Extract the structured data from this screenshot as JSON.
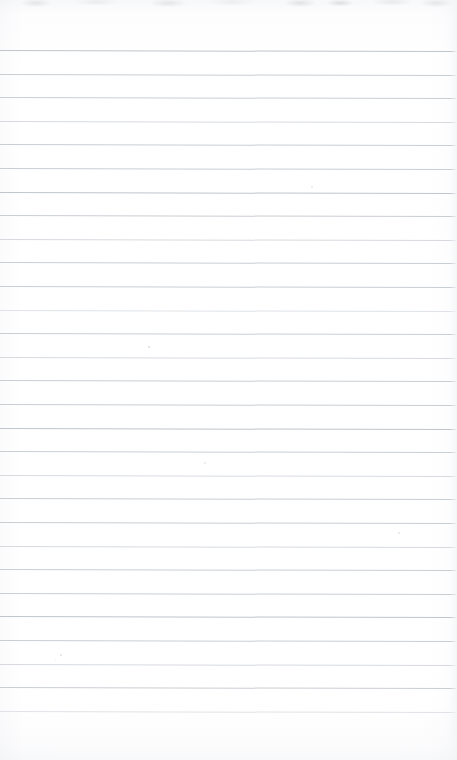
{
  "document": {
    "kind": "scanned-lined-paper",
    "title": "Blank lined notebook page",
    "page_text": "",
    "has_handwriting": false,
    "has_printed_text": false,
    "width_px": 457,
    "height_px": 760
  },
  "appearance": {
    "paper_color": "#ffffff",
    "paper_tint": "#fbfbfc",
    "rule_color": "#c9ced3",
    "rule_color_light": "#dfe3e7",
    "rule_color_dark": "#bfc5cb",
    "edge_shadow_color": "#f7f8f9",
    "smudge_color": "#c4c8cd"
  },
  "ruling": {
    "line_count": 29,
    "first_line_y": 50,
    "spacing_px": 23.6,
    "line_thickness_px": 1,
    "left_inset_px": 0,
    "right_inset_px": 0,
    "skew_deg": 0.14,
    "margin_rule": "none",
    "holes": "none",
    "line_y_positions": [
      50,
      73.6,
      97.2,
      120.8,
      144.4,
      168,
      191.6,
      215.2,
      238.8,
      262.4,
      286,
      309.6,
      333.2,
      356.8,
      380.4,
      404,
      427.6,
      451.2,
      474.8,
      498.4,
      522,
      545.6,
      569.2,
      592.8,
      616.4,
      640,
      663.6,
      687.2,
      710.8
    ],
    "line_weights": [
      "dark",
      "normal",
      "normal",
      "soft",
      "normal",
      "normal",
      "dark",
      "normal",
      "soft",
      "normal",
      "normal",
      "softer",
      "normal",
      "soft",
      "normal",
      "normal",
      "dark",
      "normal",
      "soft",
      "normal",
      "normal",
      "soft",
      "normal",
      "normal",
      "dark",
      "normal",
      "soft",
      "normal",
      "softer"
    ]
  },
  "specks": [
    {
      "x": 148,
      "y": 346,
      "size": 2.2,
      "color": "rgba(205,209,214,0.75)"
    },
    {
      "x": 60,
      "y": 654,
      "size": 2.0,
      "color": "rgba(209,213,218,0.70)"
    },
    {
      "x": 55,
      "y": 660,
      "size": 1.4,
      "color": "rgba(214,218,222,0.60)"
    },
    {
      "x": 311,
      "y": 186,
      "size": 1.6,
      "color": "rgba(216,220,224,0.55)"
    },
    {
      "x": 204,
      "y": 462,
      "size": 1.5,
      "color": "rgba(214,218,223,0.55)"
    },
    {
      "x": 398,
      "y": 532,
      "size": 1.8,
      "color": "rgba(211,215,220,0.60)"
    },
    {
      "x": 122,
      "y": 598,
      "size": 1.3,
      "color": "rgba(218,222,226,0.50)"
    }
  ]
}
